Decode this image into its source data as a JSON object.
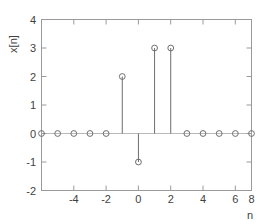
{
  "chart_data": {
    "type": "scatter",
    "plot_style": "stem",
    "title": "",
    "subtitle": "",
    "xlabel": "n",
    "ylabel": "x[n]",
    "x": [
      -5,
      -4,
      -3,
      -2,
      -1,
      0,
      1,
      2,
      3,
      4,
      5,
      6,
      7,
      8
    ],
    "values": [
      0,
      0,
      0,
      0,
      0,
      2,
      -1,
      3,
      3,
      0,
      0,
      0,
      0,
      0
    ],
    "series": [
      {
        "name": "x[n]",
        "values": [
          0,
          0,
          0,
          0,
          0,
          2,
          -1,
          3,
          3,
          0,
          0,
          0,
          0,
          0
        ]
      }
    ],
    "xlim": [
      -5,
      8
    ],
    "ylim": [
      -2,
      4
    ],
    "xticks": [
      -4,
      -2,
      0,
      2,
      4,
      6,
      8
    ],
    "xtick_labels": [
      "-4",
      "-2",
      "0",
      "2",
      "4",
      "6",
      "8"
    ],
    "yticks": [
      -2,
      -1,
      0,
      1,
      2,
      3,
      4
    ],
    "ytick_labels": [
      "-2",
      "-1",
      "0",
      "1",
      "2",
      "3",
      "4"
    ],
    "grid": false,
    "legend": null,
    "legend_position": "none",
    "marker": "open-circle",
    "baseline_y": 0,
    "annotations": [],
    "colors": {
      "background": "#ffffff",
      "axis": "#9a9a9a",
      "stem": "#6e6e6e",
      "baseline": "#b9b9b9",
      "text": "#3f3f3f"
    }
  }
}
